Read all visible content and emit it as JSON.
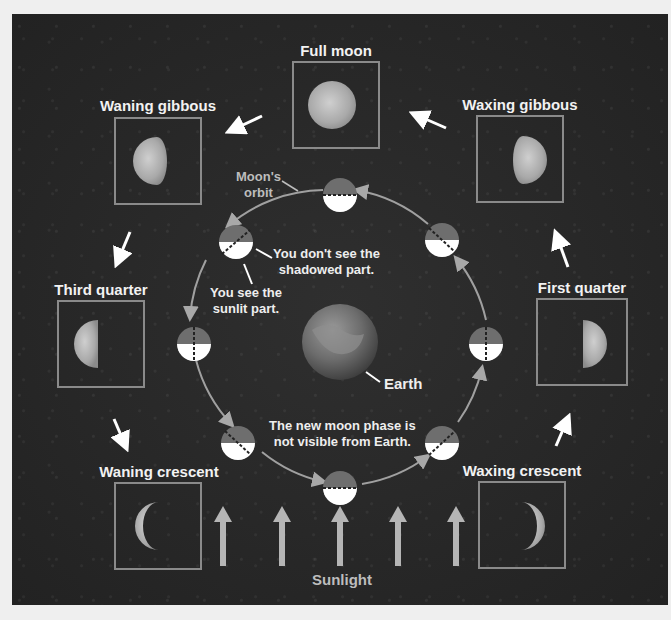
{
  "diagram": {
    "phases": [
      {
        "id": "full",
        "label": "Full moon"
      },
      {
        "id": "waxing-gibbous",
        "label": "Waxing gibbous"
      },
      {
        "id": "first-quarter",
        "label": "First quarter"
      },
      {
        "id": "waxing-crescent",
        "label": "Waxing crescent"
      },
      {
        "id": "waning-gibbous",
        "label": "Waning gibbous"
      },
      {
        "id": "third-quarter",
        "label": "Third quarter"
      },
      {
        "id": "waning-crescent",
        "label": "Waning crescent"
      }
    ],
    "annotations": {
      "orbit": "Moon's\norbit",
      "shadowed": "You don't see the\nshadowed part.",
      "sunlit": "You see the\nsunlit part.",
      "earth": "Earth",
      "new_moon": "The new moon phase is\nnot visible from Earth.",
      "sunlight": "Sunlight"
    },
    "colors": {
      "background": "#262626",
      "box_border": "#8a8a8a",
      "orbit_line": "#a0a0a0",
      "sunlight_arrow": "#b5b5b5",
      "moon_lit": "#ffffff",
      "moon_dark": "#6e6e6e",
      "label": "#f2f2f2"
    }
  }
}
